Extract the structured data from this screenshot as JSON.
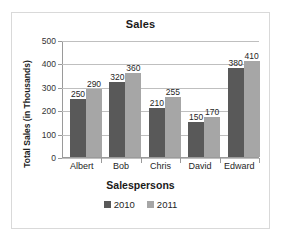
{
  "chart_data": {
    "type": "bar",
    "title": "Sales",
    "xlabel": "Salespersons",
    "ylabel": "Total Sales (in Thousands)",
    "categories": [
      "Albert",
      "Bob",
      "Chris",
      "David",
      "Edward"
    ],
    "series": [
      {
        "name": "2010",
        "color": "#595959",
        "values": [
          250,
          320,
          210,
          150,
          380
        ]
      },
      {
        "name": "2011",
        "color": "#a6a6a6",
        "values": [
          290,
          360,
          255,
          170,
          410
        ]
      }
    ],
    "ylim": [
      0,
      500
    ],
    "yticks": [
      0,
      100,
      200,
      300,
      400,
      500
    ],
    "ytick_labels": [
      "0",
      "100",
      "200",
      "300",
      "400",
      "500"
    ],
    "grid": "horizontal",
    "data_labels": true,
    "legend_position": "bottom",
    "frame_color": "#d9d9d9",
    "gridline_color": "#bfbfbf",
    "axis_color": "#9a9a9a"
  }
}
